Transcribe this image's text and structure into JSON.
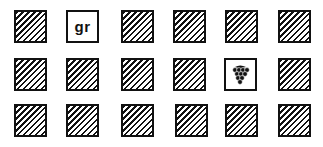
{
  "grid": {
    "rows": 3,
    "columns": 6,
    "tiles": [
      {
        "row": 0,
        "col": 0,
        "type": "hatched"
      },
      {
        "row": 0,
        "col": 1,
        "type": "text",
        "label": "gr"
      },
      {
        "row": 0,
        "col": 2,
        "type": "hatched"
      },
      {
        "row": 0,
        "col": 3,
        "type": "hatched"
      },
      {
        "row": 0,
        "col": 4,
        "type": "hatched"
      },
      {
        "row": 0,
        "col": 5,
        "type": "hatched"
      },
      {
        "row": 1,
        "col": 0,
        "type": "hatched"
      },
      {
        "row": 1,
        "col": 1,
        "type": "hatched"
      },
      {
        "row": 1,
        "col": 2,
        "type": "hatched"
      },
      {
        "row": 1,
        "col": 3,
        "type": "hatched"
      },
      {
        "row": 1,
        "col": 4,
        "type": "icon",
        "icon": "grapes-icon"
      },
      {
        "row": 1,
        "col": 5,
        "type": "hatched"
      },
      {
        "row": 2,
        "col": 0,
        "type": "hatched"
      },
      {
        "row": 2,
        "col": 1,
        "type": "hatched"
      },
      {
        "row": 2,
        "col": 2,
        "type": "hatched"
      },
      {
        "row": 2,
        "col": 3,
        "type": "hatched"
      },
      {
        "row": 2,
        "col": 4,
        "type": "hatched"
      },
      {
        "row": 2,
        "col": 5,
        "type": "hatched"
      }
    ]
  },
  "colors": {
    "ink": "#111111",
    "background": "#ffffff"
  }
}
